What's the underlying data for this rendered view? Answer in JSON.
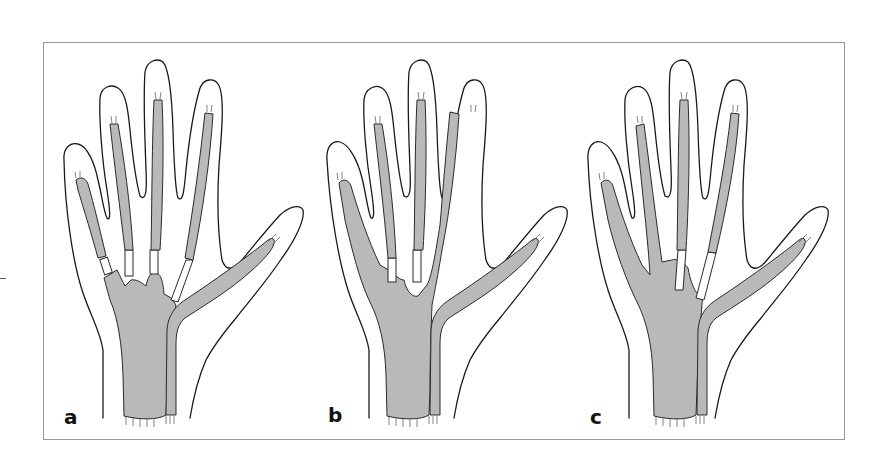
{
  "figure": {
    "panels": [
      {
        "label": "a",
        "description": "Hand with separate finger flexor tendon sheaths, thumb sheath continuous to wrist"
      },
      {
        "label": "b",
        "description": "Hand with little finger sheath continuous with ulnar bursa"
      },
      {
        "label": "c",
        "description": "Hand with little and ring finger sheaths continuous with ulnar bursa"
      }
    ],
    "colors": {
      "tendon_fill": "#b9b9b9",
      "outline": "#1a1a1a",
      "frame": "#9a9a9a",
      "background": "#ffffff"
    }
  }
}
